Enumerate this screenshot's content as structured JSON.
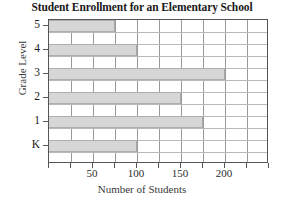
{
  "chart_data": {
    "type": "bar",
    "orientation": "horizontal",
    "title": "Student Enrollment for an Elementary School",
    "xlabel": "Number of Students",
    "ylabel": "Grade Level",
    "categories": [
      "K",
      "1",
      "2",
      "3",
      "4",
      "5"
    ],
    "values": [
      100,
      175,
      150,
      200,
      100,
      75
    ],
    "xlim": [
      0,
      250
    ],
    "ylim_categories": [
      "K",
      "1",
      "2",
      "3",
      "4",
      "5"
    ],
    "x_tick_values": [
      0,
      25,
      50,
      75,
      100,
      125,
      150,
      175,
      200,
      225,
      250
    ],
    "x_tick_labels": [
      "",
      "",
      "50",
      "",
      "100",
      "",
      "150",
      "",
      "200",
      "",
      ""
    ],
    "y_tick_labels": [
      "5",
      "4",
      "3",
      "2",
      "1",
      "K"
    ],
    "grid": true,
    "legend": "none",
    "bar_color": "#d6d6d6",
    "bar_edge_color": "#aeaeae",
    "axis_color": "#555555",
    "grid_color": "#9a9a9a",
    "background": "#ffffff",
    "series": [
      {
        "name": "Enrollment",
        "points": [
          {
            "category": "K",
            "value": 100
          },
          {
            "category": "1",
            "value": 175
          },
          {
            "category": "2",
            "value": 150
          },
          {
            "category": "3",
            "value": 200
          },
          {
            "category": "4",
            "value": 100
          },
          {
            "category": "5",
            "value": 75
          }
        ]
      }
    ]
  }
}
